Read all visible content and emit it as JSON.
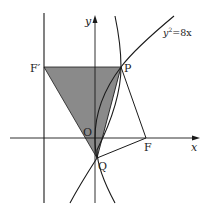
{
  "figure": {
    "type": "coordinate-geometry-diagram",
    "axes": {
      "x_label": "x",
      "y_label": "y",
      "origin_label": "O"
    },
    "curves": [
      {
        "name": "parabola",
        "equation_label": "y²=8x",
        "eq_base": "y",
        "eq_exp": "2",
        "eq_rest": "=8x"
      },
      {
        "name": "second-curve",
        "equation_label": ""
      }
    ],
    "points": [
      {
        "label": "F′",
        "role": "left focus on directrix line"
      },
      {
        "label": "P",
        "role": "intersection point"
      },
      {
        "label": "F",
        "role": "focus on x-axis"
      },
      {
        "label": "Q",
        "role": "intersection point below origin"
      },
      {
        "label": "O",
        "role": "origin"
      }
    ],
    "shaded_region": "triangle F′PQ",
    "segments": [
      "F′P",
      "F′Q",
      "PQ",
      "PF",
      "QF"
    ],
    "colors": {
      "shade": "#8a8a8a",
      "stroke": "#1a1a1a",
      "background": "#ffffff"
    }
  }
}
